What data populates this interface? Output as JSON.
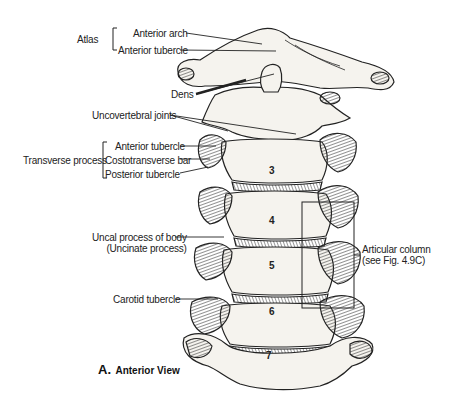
{
  "figure": {
    "caption_letter": "A.",
    "caption_text": "Anterior View"
  },
  "labels": {
    "atlas_group": "Atlas",
    "anterior_arch": "Anterior arch",
    "anterior_tubercle_atlas": "Anterior tubercle",
    "dens": "Dens",
    "uncovertebral_joints": "Uncovertebral joints",
    "transverse_process_group": "Transverse process",
    "anterior_tubercle_tp": "Anterior tubercle",
    "costotransverse_bar": "Costotransverse bar",
    "posterior_tubercle": "Posterior tubercle",
    "uncal_process_line1": "Uncal process of body",
    "uncal_process_line2": "(Uncinate process)",
    "carotid_tubercle": "Carotid tubercle",
    "articular_column_line1": "Articular column",
    "articular_column_line2": "(see Fig. 4.9C)"
  },
  "vertebra_numbers": [
    "3",
    "4",
    "5",
    "6",
    "7"
  ],
  "colors": {
    "ink": "#222222",
    "bone_fill": "#f4f2ec",
    "hatch": "#444444",
    "background": "#ffffff"
  }
}
